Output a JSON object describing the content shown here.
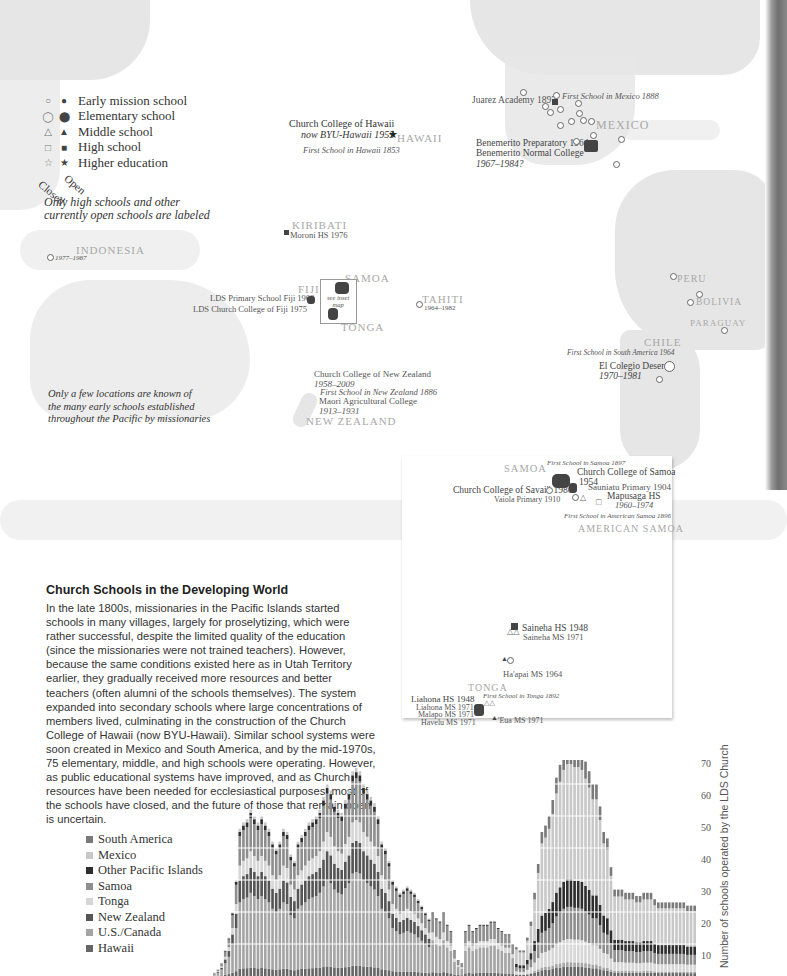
{
  "map": {
    "legend": {
      "header_closed": "Closed",
      "header_open": "Open",
      "items": [
        {
          "closed_symbol": "○",
          "open_symbol": "●",
          "label": "Early mission school",
          "icon": "circle-small-icon"
        },
        {
          "closed_symbol": "◯",
          "open_symbol": "⬤",
          "label": "Elementary school",
          "icon": "circle-icon"
        },
        {
          "closed_symbol": "△",
          "open_symbol": "▲",
          "label": "Middle school",
          "icon": "triangle-icon"
        },
        {
          "closed_symbol": "□",
          "open_symbol": "■",
          "label": "High school",
          "icon": "square-icon"
        },
        {
          "closed_symbol": "☆",
          "open_symbol": "★",
          "label": "Higher education",
          "icon": "star-icon"
        }
      ],
      "note_line1": "Only high schools and other",
      "note_line2": "currently open schools are labeled"
    },
    "regions": {
      "hawaii": "HAWAII",
      "mexico": "MEXICO",
      "kiribati": "KIRIBATI",
      "indonesia": "INDONESIA",
      "fiji": "FIJI",
      "samoa": "SAMOA",
      "tonga": "TONGA",
      "tahiti": "TAHITI",
      "new_zealand": "NEW ZEALAND",
      "peru": "PERU",
      "bolivia": "BOLIVIA",
      "paraguay": "PARAGUAY",
      "chile": "CHILE"
    },
    "labels": {
      "hawaii_college_1": "Church College of Hawaii",
      "hawaii_college_2": "now BYU-Hawaii 1955",
      "hawaii_first": "First School in Hawaii 1853",
      "juarez": "Juarez Academy 1897",
      "mexico_first": "First School in Mexico 1888",
      "benemerito_1": "Benemerito Preparatory 1964",
      "benemerito_2": "Benemerito Normal College",
      "benemerito_3": "1967–1984?",
      "moroni": "Moroni HS 1976",
      "indonesia_dates": "1977–1987",
      "fiji_primary": "LDS Primary School Fiji 1968",
      "fiji_college": "LDS Church College of Fiji 1975",
      "see_inset_1": "see inset",
      "see_inset_2": "map",
      "tahiti_dates": "1964–1982",
      "nz_college_1": "Church College of New Zealand",
      "nz_college_2": "1958–2009",
      "nz_first": "First School in New Zealand 1886",
      "maori_1": "Maori Agricultural College",
      "maori_2": "1913–1931",
      "sa_first": "First School in South America 1964",
      "deseret_1": "El Colegio Deseret",
      "deseret_2": "1970–1981",
      "early_note_1": "Only a few locations are known of",
      "early_note_2": "the many early schools established",
      "early_note_3": "throughout the Pacific by missionaries"
    }
  },
  "inset": {
    "samoa": "SAMOA",
    "american_samoa": "AMERICAN SAMOA",
    "tonga": "TONGA",
    "labels": {
      "samoa_first": "First School in Samoa 1897",
      "samoa_college_1": "Church College of Samoa",
      "samoa_college_2": "1954",
      "savaii": "Church College of Savai'i 1980",
      "sauniatu": "Sauniatu Primary 1904",
      "vaiola": "Vaiola Primary 1910",
      "mapusaga_1": "Mapusaga HS",
      "mapusaga_2": "1960–1974",
      "amsamoa_first": "First School in American Samoa 1896",
      "saineha_hs": "Saineha HS 1948",
      "saineha_ms": "Saineha MS 1971",
      "haapai": "Ha'apai MS 1964",
      "liahona_hs": "Liahona HS 1948",
      "tonga_first": "First School in Tonga 1892",
      "liahona_ms": "Liahona MS 1971",
      "malapo": "Malapo MS 1971",
      "havelu": "Havelu MS 1971",
      "eua": "'Eua MS 1971"
    }
  },
  "article": {
    "title": "Church Schools in the Developing World",
    "body": "In the late 1800s, missionaries in the Pacific Islands started schools in many villages, largely for proselytizing, which were rather successful, despite the limited quality of the education (since the missionaries were not trained teachers). However, because the same conditions existed here as in Utah Territory earlier, they gradually received more resources and better teachers (often alumni of the schools themselves). The system expanded into secondary schools where large concentrations of members lived, culminating in the construction of the Church College of Hawaii (now BYU-Hawaii). Similar school systems were soon created in Mexico and South America, and by the mid-1970s, 75 elementary, middle, and high schools were operating. However, as public educational systems have improved, and as Church resources have been needed for ecclesiastical purposes, most of the schools have closed, and the future of those that remain open is uncertain."
  },
  "chart_data": {
    "type": "bar",
    "stacked": true,
    "title": "",
    "xlabel": "",
    "ylabel": "Number of schools operated by the LDS Church",
    "ylim": [
      0,
      75
    ],
    "yticks": [
      10,
      20,
      30,
      40,
      50,
      60,
      70
    ],
    "grid": true,
    "legend_position": "left",
    "series_order_top_to_bottom": [
      "South America",
      "Mexico",
      "Other Pacific Islands",
      "Samoa",
      "Tonga",
      "New Zealand",
      "U.S./Canada",
      "Hawaii"
    ],
    "series_colors": {
      "South America": "#7a7a7a",
      "Mexico": "#c8c8c8",
      "Other Pacific Islands": "#2e2e2e",
      "Samoa": "#8e8e8e",
      "Tonga": "#d6d6d6",
      "New Zealand": "#555555",
      "U.S./Canada": "#a5a5a5",
      "Hawaii": "#666666"
    },
    "note": "Annual stacked bars (approximate totals read from gridlines, left to right)",
    "totals_approx": [
      1,
      2,
      4,
      8,
      12,
      20,
      30,
      46,
      48,
      49,
      52,
      50,
      48,
      50,
      48,
      46,
      42,
      40,
      42,
      46,
      45,
      38,
      36,
      42,
      44,
      46,
      48,
      49,
      50,
      52,
      56,
      60,
      58,
      54,
      52,
      51,
      55,
      58,
      64,
      65,
      64,
      60,
      58,
      56,
      54,
      50,
      42,
      40,
      36,
      30,
      28,
      26,
      27,
      28,
      27,
      26,
      24,
      22,
      20,
      18,
      20,
      18,
      17,
      20,
      16,
      14,
      8,
      5,
      4,
      14,
      16,
      14,
      15,
      16,
      16,
      16,
      17,
      17,
      15,
      14,
      13,
      13,
      10,
      9,
      8,
      8,
      12,
      17,
      26,
      35,
      45,
      47,
      50,
      55,
      62,
      66,
      70,
      72,
      72,
      71,
      71,
      70,
      67,
      64,
      60,
      60,
      53,
      45,
      43,
      34,
      27,
      27,
      27,
      26,
      26,
      26,
      25,
      25,
      26,
      26,
      26,
      24,
      23,
      23,
      23,
      23,
      23,
      23,
      23,
      23,
      22,
      22,
      22
    ],
    "peaks": [
      {
        "label": "early peak (Hawaii/NZ/Samoa)",
        "value": 52
      },
      {
        "label": "mid peak",
        "value": 65
      },
      {
        "label": "mid-1970s peak (Mexico surge)",
        "value": 72
      },
      {
        "label": "current",
        "value": 22
      }
    ]
  },
  "chart_legend": [
    {
      "label": "South America",
      "color": "#7a7a7a"
    },
    {
      "label": "Mexico",
      "color": "#c8c8c8"
    },
    {
      "label": "Other Pacific Islands",
      "color": "#2e2e2e"
    },
    {
      "label": "Samoa",
      "color": "#8e8e8e"
    },
    {
      "label": "Tonga",
      "color": "#d6d6d6"
    },
    {
      "label": "New Zealand",
      "color": "#555555"
    },
    {
      "label": "U.S./Canada",
      "color": "#a5a5a5"
    },
    {
      "label": "Hawaii",
      "color": "#666666"
    }
  ],
  "y_ticks": [
    "70",
    "60",
    "50",
    "40",
    "30",
    "20",
    "10"
  ]
}
